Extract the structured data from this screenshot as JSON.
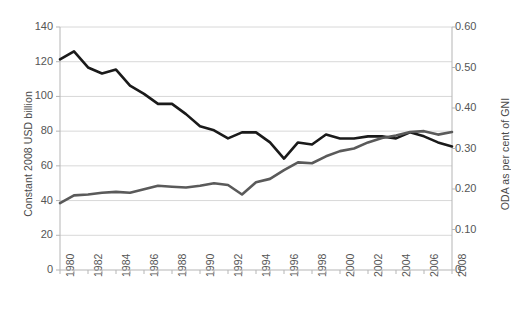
{
  "chart_data": {
    "type": "line",
    "title": "",
    "subtitle": "",
    "xlabel": "",
    "ylabel": "Constant 2008 USD billion",
    "ylabel_secondary": "ODA as per cent of GNI",
    "grid": true,
    "legend": "none",
    "x": [
      1980,
      1981,
      1982,
      1983,
      1984,
      1985,
      1986,
      1987,
      1988,
      1989,
      1990,
      1991,
      1992,
      1993,
      1994,
      1995,
      1996,
      1997,
      1998,
      1999,
      2000,
      2001,
      2002,
      2003,
      2004,
      2005,
      2006,
      2007,
      2008
    ],
    "xticklabels": [
      "1980",
      "1982",
      "1984",
      "1986",
      "1988",
      "1990",
      "1992",
      "1994",
      "1996",
      "1998",
      "2000",
      "2002",
      "2004",
      "2006",
      "2008"
    ],
    "ylim": [
      0,
      140
    ],
    "yticks": [
      0,
      20,
      40,
      60,
      80,
      100,
      120,
      140
    ],
    "yticklabels": [
      "0",
      "20",
      "40",
      "60",
      "80",
      "100",
      "120",
      "140"
    ],
    "ylim_secondary": [
      0,
      0.6
    ],
    "yticks_secondary": [
      0,
      0.1,
      0.2,
      0.3,
      0.4,
      0.5,
      0.6
    ],
    "yticklabels_secondary": [
      "0",
      "0.10",
      "0.20",
      "0.30",
      "0.40",
      "0.50",
      "0.60"
    ],
    "series": [
      {
        "name": "ODA as per cent of GNI",
        "axis": "right",
        "color": "#1a1a1a",
        "linewidth": 2.6,
        "values_secondary": [
          0.52,
          0.54,
          0.5,
          0.485,
          0.495,
          0.455,
          0.435,
          0.41,
          0.41,
          0.385,
          0.355,
          0.345,
          0.325,
          0.34,
          0.34,
          0.315,
          0.275,
          0.315,
          0.31,
          0.335,
          0.325,
          0.325,
          0.33,
          0.33,
          0.325,
          0.34,
          0.33,
          0.315,
          0.305
        ],
        "values_left_scale": [
          121.3,
          126.0,
          116.7,
          113.2,
          115.5,
          106.2,
          101.5,
          95.7,
          95.7,
          89.8,
          82.8,
          80.5,
          75.8,
          79.3,
          79.3,
          73.5,
          64.2,
          73.5,
          72.3,
          78.1,
          75.8,
          75.8,
          77.0,
          77.0,
          75.8,
          79.3,
          77.0,
          73.5,
          71.2
        ]
      },
      {
        "name": "ODA volume (constant 2008 USD billion)",
        "axis": "left",
        "color": "#5a5a5a",
        "linewidth": 2.6,
        "values": [
          38.5,
          43.0,
          43.5,
          44.5,
          45.0,
          44.5,
          46.5,
          48.5,
          48.0,
          47.5,
          48.5,
          50.0,
          49.0,
          43.5,
          50.5,
          52.5,
          57.5,
          62.0,
          61.5,
          65.5,
          68.5,
          70.0,
          73.5,
          76.0,
          77.5,
          79.5,
          80.0,
          78.0,
          79.5
        ]
      }
    ],
    "series_alt_note": ""
  },
  "axes": {
    "left_title": "Constant 2008 USD billion",
    "right_title": "ODA as per cent of GNI"
  }
}
